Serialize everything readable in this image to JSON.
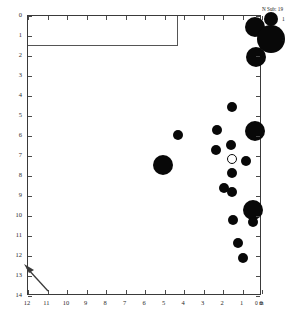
{
  "figure": {
    "type": "bubble-scatter",
    "background_color": "#ffffff",
    "axis_color": "#3a3a3a"
  },
  "axes": {
    "x": {
      "label_unit": "0 m",
      "tick_labels": [
        "12",
        "11",
        "10",
        "9",
        "8",
        "7",
        "6",
        "5",
        "4",
        "3",
        "2",
        "1",
        "0"
      ],
      "range": [
        12,
        0
      ],
      "reversed": true
    },
    "y": {
      "tick_labels": [
        "0",
        "1",
        "2",
        "3",
        "4",
        "5",
        "6",
        "7",
        "8",
        "9",
        "10",
        "11",
        "12",
        "13",
        "14"
      ],
      "range": [
        0,
        14
      ],
      "reversed": false
    }
  },
  "legend": {
    "title": "N Sub: 19",
    "entries": [
      {
        "label": "1",
        "size_px": 7
      },
      {
        "label": "2",
        "size_px": 14
      }
    ]
  },
  "chart_data": {
    "type": "scatter",
    "title": "N Sub: 19",
    "xlabel": "0 m",
    "ylabel": "",
    "xlim": [
      12,
      0
    ],
    "ylim": [
      14,
      0
    ],
    "grid": false,
    "legend_position": "right",
    "size_legend": {
      "title": "N Sub: 19",
      "values": [
        1,
        2
      ]
    },
    "points": [
      {
        "x": 0.35,
        "y": 0.55,
        "size": 2.0,
        "filled": true
      },
      {
        "x": 0.3,
        "y": 2.05,
        "size": 2.0,
        "filled": true
      },
      {
        "x": 1.55,
        "y": 4.55,
        "size": 1.0,
        "filled": true
      },
      {
        "x": 0.35,
        "y": 5.75,
        "size": 2.0,
        "filled": true
      },
      {
        "x": 2.3,
        "y": 5.7,
        "size": 1.0,
        "filled": true
      },
      {
        "x": 4.3,
        "y": 5.95,
        "size": 1.0,
        "filled": true
      },
      {
        "x": 2.35,
        "y": 6.7,
        "size": 1.0,
        "filled": true
      },
      {
        "x": 1.6,
        "y": 6.45,
        "size": 1.0,
        "filled": true
      },
      {
        "x": 1.55,
        "y": 7.15,
        "size": 1.0,
        "filled": false
      },
      {
        "x": 0.8,
        "y": 7.25,
        "size": 1.0,
        "filled": true
      },
      {
        "x": 5.1,
        "y": 7.45,
        "size": 2.0,
        "filled": true
      },
      {
        "x": 1.55,
        "y": 7.85,
        "size": 1.0,
        "filled": true
      },
      {
        "x": 1.95,
        "y": 8.6,
        "size": 1.0,
        "filled": true
      },
      {
        "x": 1.55,
        "y": 8.8,
        "size": 1.0,
        "filled": true
      },
      {
        "x": 0.45,
        "y": 9.7,
        "size": 2.0,
        "filled": true
      },
      {
        "x": 1.5,
        "y": 10.2,
        "size": 1.0,
        "filled": true
      },
      {
        "x": 0.45,
        "y": 10.3,
        "size": 1.0,
        "filled": true
      },
      {
        "x": 1.25,
        "y": 11.35,
        "size": 1.0,
        "filled": true
      },
      {
        "x": 1.0,
        "y": 12.1,
        "size": 1.0,
        "filled": true
      }
    ],
    "annotations": [
      {
        "type": "arrow",
        "x_tail": 11.1,
        "y_tail": 13.6,
        "x_head": 11.9,
        "y_head": 12.8
      },
      {
        "type": "inset-box",
        "x_left": 12.0,
        "x_right": 4.3,
        "y_top": 0.0,
        "y_bottom": 1.5
      }
    ]
  }
}
